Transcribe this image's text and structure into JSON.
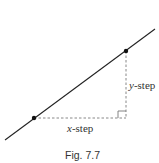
{
  "figure": {
    "caption": "Fig. 7.7",
    "labels": {
      "x_step_var": "x",
      "x_step_rest": "-step",
      "y_step_var": "y",
      "y_step_rest": "-step"
    },
    "colors": {
      "line": "#222222",
      "dashed": "#888888",
      "point": "#111111"
    }
  }
}
